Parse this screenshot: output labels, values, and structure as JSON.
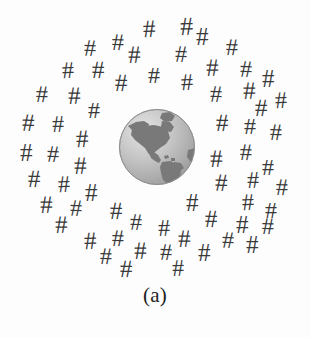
{
  "figure": {
    "caption": "(a)",
    "background_color": "#fdfdfd",
    "width": 310,
    "height": 338
  },
  "globe": {
    "name": "globe-illustration",
    "alt_text": "Earth globe showing North and South America",
    "center_x": 157,
    "center_y": 147,
    "diameter": 78,
    "ocean_color": "#b9b9b9",
    "ocean_highlight_color": "#e2e2e2",
    "land_color": "#7a7a7a",
    "outline_color": "#8e8e8e"
  },
  "hash_glyph": {
    "character": "#",
    "color": "#3a3a3a",
    "count": 62
  },
  "hash_symbols": [
    {
      "x": 143,
      "y": 16,
      "size": 25,
      "rot": -2
    },
    {
      "x": 112,
      "y": 30,
      "size": 24,
      "rot": 1
    },
    {
      "x": 180,
      "y": 14,
      "size": 26,
      "rot": -1
    },
    {
      "x": 84,
      "y": 36,
      "size": 24,
      "rot": 2
    },
    {
      "x": 196,
      "y": 24,
      "size": 25,
      "rot": 0
    },
    {
      "x": 226,
      "y": 35,
      "size": 24,
      "rot": 1
    },
    {
      "x": 128,
      "y": 42,
      "size": 25,
      "rot": -1
    },
    {
      "x": 175,
      "y": 42,
      "size": 24,
      "rot": 2
    },
    {
      "x": 62,
      "y": 58,
      "size": 24,
      "rot": -2
    },
    {
      "x": 92,
      "y": 57,
      "size": 25,
      "rot": 1
    },
    {
      "x": 148,
      "y": 63,
      "size": 24,
      "rot": 0
    },
    {
      "x": 206,
      "y": 55,
      "size": 25,
      "rot": -1
    },
    {
      "x": 240,
      "y": 57,
      "size": 24,
      "rot": 2
    },
    {
      "x": 115,
      "y": 70,
      "size": 25,
      "rot": 1
    },
    {
      "x": 181,
      "y": 70,
      "size": 24,
      "rot": -2
    },
    {
      "x": 262,
      "y": 66,
      "size": 25,
      "rot": 0
    },
    {
      "x": 36,
      "y": 82,
      "size": 24,
      "rot": 1
    },
    {
      "x": 68,
      "y": 83,
      "size": 25,
      "rot": -1
    },
    {
      "x": 210,
      "y": 82,
      "size": 24,
      "rot": 2
    },
    {
      "x": 243,
      "y": 78,
      "size": 25,
      "rot": -1
    },
    {
      "x": 88,
      "y": 98,
      "size": 24,
      "rot": 0
    },
    {
      "x": 255,
      "y": 95,
      "size": 25,
      "rot": 1
    },
    {
      "x": 275,
      "y": 88,
      "size": 24,
      "rot": -2
    },
    {
      "x": 22,
      "y": 110,
      "size": 25,
      "rot": 2
    },
    {
      "x": 52,
      "y": 112,
      "size": 24,
      "rot": -1
    },
    {
      "x": 216,
      "y": 110,
      "size": 25,
      "rot": 1
    },
    {
      "x": 244,
      "y": 114,
      "size": 24,
      "rot": 0
    },
    {
      "x": 76,
      "y": 126,
      "size": 25,
      "rot": -2
    },
    {
      "x": 270,
      "y": 120,
      "size": 24,
      "rot": 1
    },
    {
      "x": 20,
      "y": 140,
      "size": 25,
      "rot": 0
    },
    {
      "x": 47,
      "y": 142,
      "size": 24,
      "rot": 2
    },
    {
      "x": 210,
      "y": 146,
      "size": 25,
      "rot": -1
    },
    {
      "x": 240,
      "y": 140,
      "size": 24,
      "rot": 1
    },
    {
      "x": 74,
      "y": 153,
      "size": 25,
      "rot": -1
    },
    {
      "x": 262,
      "y": 155,
      "size": 24,
      "rot": 0
    },
    {
      "x": 28,
      "y": 166,
      "size": 25,
      "rot": 1
    },
    {
      "x": 58,
      "y": 172,
      "size": 24,
      "rot": -2
    },
    {
      "x": 215,
      "y": 170,
      "size": 25,
      "rot": 2
    },
    {
      "x": 247,
      "y": 168,
      "size": 24,
      "rot": -1
    },
    {
      "x": 85,
      "y": 180,
      "size": 25,
      "rot": 0
    },
    {
      "x": 276,
      "y": 175,
      "size": 24,
      "rot": 1
    },
    {
      "x": 40,
      "y": 192,
      "size": 25,
      "rot": -1
    },
    {
      "x": 70,
      "y": 196,
      "size": 24,
      "rot": 2
    },
    {
      "x": 186,
      "y": 190,
      "size": 25,
      "rot": 0
    },
    {
      "x": 242,
      "y": 190,
      "size": 24,
      "rot": -2
    },
    {
      "x": 110,
      "y": 198,
      "size": 25,
      "rot": 1
    },
    {
      "x": 265,
      "y": 198,
      "size": 24,
      "rot": 0
    },
    {
      "x": 55,
      "y": 212,
      "size": 25,
      "rot": -1
    },
    {
      "x": 130,
      "y": 210,
      "size": 24,
      "rot": 2
    },
    {
      "x": 205,
      "y": 206,
      "size": 25,
      "rot": 1
    },
    {
      "x": 158,
      "y": 216,
      "size": 24,
      "rot": -1
    },
    {
      "x": 236,
      "y": 212,
      "size": 25,
      "rot": 0
    },
    {
      "x": 262,
      "y": 214,
      "size": 24,
      "rot": 1
    },
    {
      "x": 84,
      "y": 228,
      "size": 25,
      "rot": -2
    },
    {
      "x": 112,
      "y": 226,
      "size": 24,
      "rot": 1
    },
    {
      "x": 178,
      "y": 226,
      "size": 25,
      "rot": -1
    },
    {
      "x": 222,
      "y": 228,
      "size": 24,
      "rot": 2
    },
    {
      "x": 246,
      "y": 232,
      "size": 25,
      "rot": 0
    },
    {
      "x": 100,
      "y": 244,
      "size": 24,
      "rot": 1
    },
    {
      "x": 134,
      "y": 238,
      "size": 25,
      "rot": -1
    },
    {
      "x": 160,
      "y": 240,
      "size": 24,
      "rot": 2
    },
    {
      "x": 198,
      "y": 240,
      "size": 25,
      "rot": 0
    },
    {
      "x": 120,
      "y": 256,
      "size": 25,
      "rot": 1
    },
    {
      "x": 172,
      "y": 256,
      "size": 24,
      "rot": -1
    }
  ]
}
